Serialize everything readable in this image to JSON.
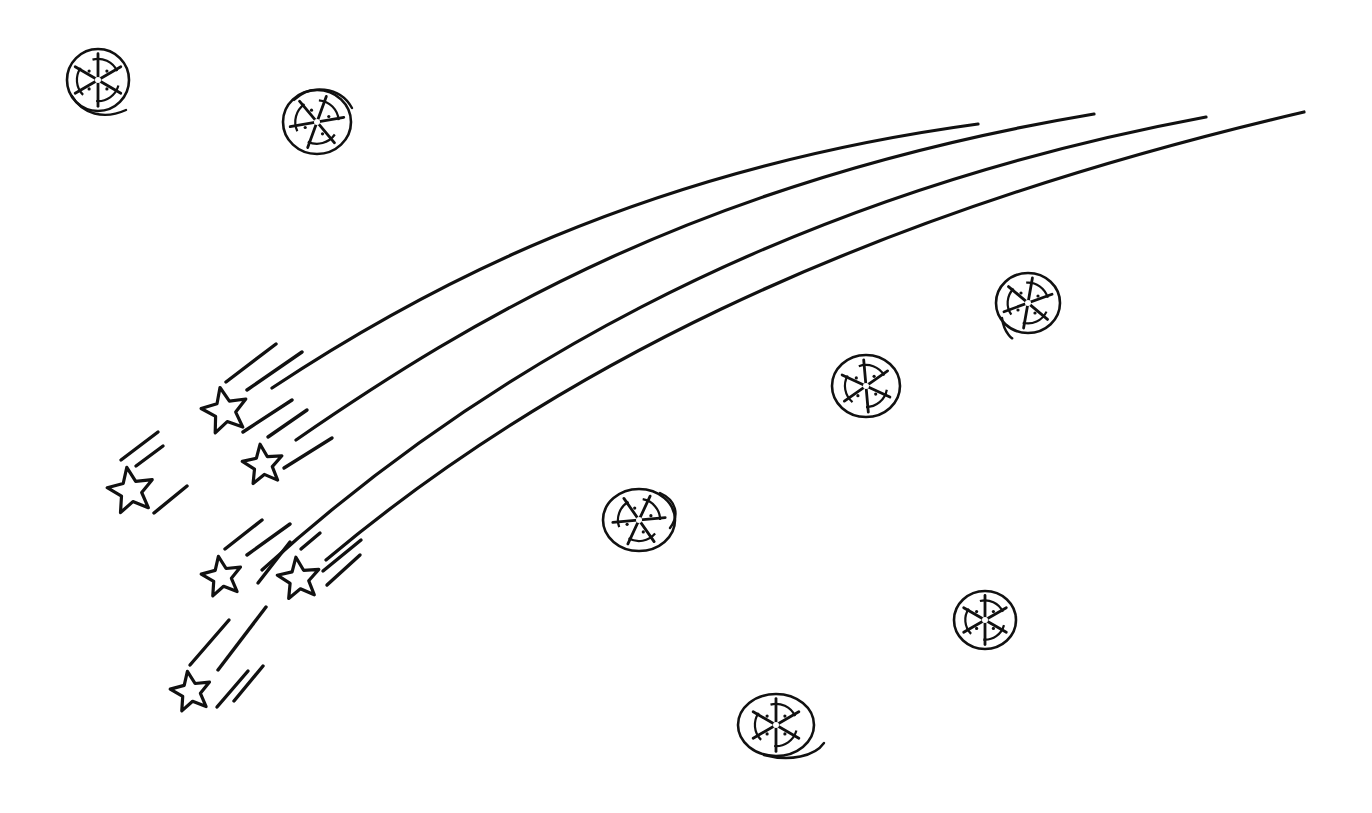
{
  "scene": {
    "description": "Hand-drawn line art of shooting stars with long curved trails and round snowflake-like ornaments",
    "background": "#ffffff",
    "ink": "#111111",
    "width": 1372,
    "height": 813
  },
  "trails": [
    {
      "d": "M 272 388 C 420 290, 640 170, 978 124"
    },
    {
      "d": "M 296 440 C 470 320, 700 180, 1094 114"
    },
    {
      "d": "M 262 570 C 460 390, 760 200, 1206 117"
    },
    {
      "d": "M 326 560 C 540 380, 840 220, 1304 112"
    }
  ],
  "stars": [
    {
      "name": "star-1",
      "cx": 225,
      "cy": 411,
      "r": 24,
      "rot": -12
    },
    {
      "name": "star-2",
      "cx": 263,
      "cy": 465,
      "r": 21,
      "rot": -8
    },
    {
      "name": "star-3",
      "cx": 131,
      "cy": 491,
      "r": 24,
      "rot": -10
    },
    {
      "name": "star-4",
      "cx": 222,
      "cy": 577,
      "r": 21,
      "rot": -10
    },
    {
      "name": "star-5",
      "cx": 299,
      "cy": 579,
      "r": 22,
      "rot": -8
    },
    {
      "name": "star-6",
      "cx": 191,
      "cy": 692,
      "r": 21,
      "rot": -10
    }
  ],
  "streaks": [
    {
      "x1": 226,
      "y1": 382,
      "x2": 276,
      "y2": 344
    },
    {
      "x1": 247,
      "y1": 390,
      "x2": 302,
      "y2": 352
    },
    {
      "x1": 243,
      "y1": 432,
      "x2": 292,
      "y2": 400
    },
    {
      "x1": 268,
      "y1": 437,
      "x2": 307,
      "y2": 410
    },
    {
      "x1": 284,
      "y1": 468,
      "x2": 332,
      "y2": 438
    },
    {
      "x1": 121,
      "y1": 460,
      "x2": 158,
      "y2": 432
    },
    {
      "x1": 136,
      "y1": 466,
      "x2": 163,
      "y2": 446
    },
    {
      "x1": 154,
      "y1": 513,
      "x2": 187,
      "y2": 486
    },
    {
      "x1": 225,
      "y1": 549,
      "x2": 262,
      "y2": 520
    },
    {
      "x1": 258,
      "y1": 583,
      "x2": 290,
      "y2": 542
    },
    {
      "x1": 247,
      "y1": 555,
      "x2": 290,
      "y2": 524
    },
    {
      "x1": 301,
      "y1": 549,
      "x2": 320,
      "y2": 533
    },
    {
      "x1": 323,
      "y1": 571,
      "x2": 361,
      "y2": 540
    },
    {
      "x1": 327,
      "y1": 585,
      "x2": 360,
      "y2": 555
    },
    {
      "x1": 190,
      "y1": 665,
      "x2": 229,
      "y2": 620
    },
    {
      "x1": 218,
      "y1": 670,
      "x2": 266,
      "y2": 607
    },
    {
      "x1": 217,
      "y1": 707,
      "x2": 248,
      "y2": 671
    },
    {
      "x1": 234,
      "y1": 701,
      "x2": 263,
      "y2": 666
    }
  ],
  "ornaments": [
    {
      "name": "ornament-1",
      "cx": 98,
      "cy": 80,
      "rx": 31,
      "ry": 31,
      "tail": "M 72 96 C 82 114, 104 120, 126 110",
      "rot": 0
    },
    {
      "name": "ornament-2",
      "cx": 317,
      "cy": 122,
      "rx": 34,
      "ry": 32,
      "tail": "M 294 100 C 310 84, 340 86, 352 108",
      "rot": 20
    },
    {
      "name": "ornament-3",
      "cx": 1028,
      "cy": 303,
      "rx": 32,
      "ry": 30,
      "tail": "M 1002 318 C 1004 334, 1014 340, 1012 338",
      "rot": 10
    },
    {
      "name": "ornament-4",
      "cx": 866,
      "cy": 386,
      "rx": 34,
      "ry": 31,
      "tail": "",
      "rot": -5
    },
    {
      "name": "ornament-5",
      "cx": 639,
      "cy": 520,
      "rx": 36,
      "ry": 31,
      "tail": "M 660 493 C 676 500, 680 515, 670 528",
      "rot": 25
    },
    {
      "name": "ornament-6",
      "cx": 985,
      "cy": 620,
      "rx": 31,
      "ry": 29,
      "tail": "",
      "rot": 0
    },
    {
      "name": "ornament-7",
      "cx": 776,
      "cy": 725,
      "rx": 38,
      "ry": 31,
      "tail": "M 764 755 C 790 762, 815 756, 824 743",
      "rot": 0
    }
  ]
}
